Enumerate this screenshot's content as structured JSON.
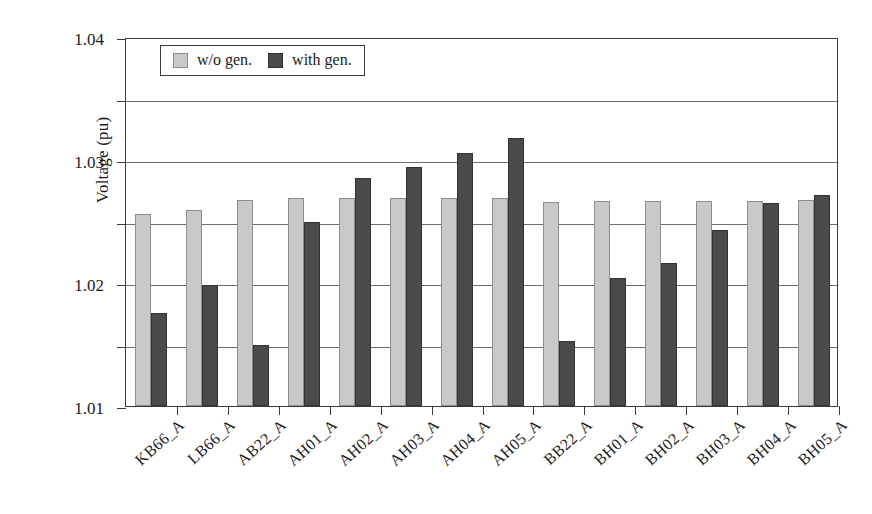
{
  "chart_data": {
    "type": "bar",
    "title": "",
    "xlabel": "",
    "ylabel": "Voltage (pu)",
    "ylim": [
      0.98,
      1.04
    ],
    "ytick_step": 0.01,
    "ytick_labels": [
      "1.04",
      "1.03",
      "1.02",
      "1.01",
      "1.00",
      "0.99",
      "0.98"
    ],
    "ytick_values": [
      1.04,
      1.03,
      1.02,
      1.01,
      1.0,
      0.99,
      0.98
    ],
    "grid": true,
    "legend_position": "upper-left-inside",
    "categories": [
      "KB66_A",
      "LB66_A",
      "AB22_A",
      "AH01_A",
      "AH02_A",
      "AH03_A",
      "AH04_A",
      "AH05_A",
      "BB22_A",
      "BH01_A",
      "BH02_A",
      "BH03_A",
      "BH04_A",
      "BH05_A"
    ],
    "series": [
      {
        "name": "w/o gen.",
        "color": "#c9c9c9",
        "values": [
          1.0113,
          1.0119,
          1.0135,
          1.0139,
          1.0139,
          1.0139,
          1.0139,
          1.0139,
          1.0131,
          1.0133,
          1.0133,
          1.0133,
          1.0133,
          1.0135
        ]
      },
      {
        "name": "with gen.",
        "color": "#4a4a4a",
        "values": [
          0.9952,
          0.9996,
          0.99,
          1.01,
          1.0171,
          1.0189,
          1.0211,
          1.0235,
          0.9906,
          1.0008,
          1.0032,
          1.0086,
          1.013,
          1.0143
        ]
      }
    ]
  },
  "legend": {
    "items": [
      {
        "label": "w/o gen.",
        "swatch": "light"
      },
      {
        "label": "with gen.",
        "swatch": "dark"
      }
    ]
  }
}
